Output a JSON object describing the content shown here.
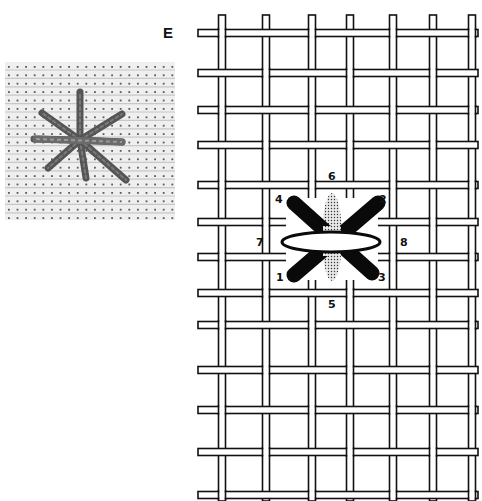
{
  "figure": {
    "label": "E"
  },
  "photo": {
    "description": "Photo of an eight-ray star stitch on evenweave fabric",
    "star_center": [
      80,
      140
    ],
    "rays": [
      [
        80,
        92
      ],
      [
        42,
        113
      ],
      [
        122,
        114
      ],
      [
        34,
        139
      ],
      [
        122,
        142
      ],
      [
        48,
        168
      ],
      [
        86,
        178
      ],
      [
        126,
        180
      ]
    ],
    "thread_color": "#555555",
    "fabric_color": "#efefef",
    "hole_color": "#2a2a2a"
  },
  "grid": {
    "vertical_threads_x": [
      222,
      266,
      312,
      350,
      393,
      433,
      472
    ],
    "horizontal_threads_y": [
      33,
      73,
      110,
      145,
      185,
      222,
      257,
      293,
      325,
      370,
      410,
      452,
      495
    ],
    "x_start": 198,
    "x_end": 478,
    "y_start": 15,
    "y_end": 501,
    "thread_width": 7,
    "stroke_color": "#111111"
  },
  "stitch": {
    "labels": [
      {
        "n": "1",
        "x": 276,
        "y": 281
      },
      {
        "n": "2",
        "x": 379,
        "y": 203
      },
      {
        "n": "3",
        "x": 378,
        "y": 281
      },
      {
        "n": "4",
        "x": 275,
        "y": 203
      },
      {
        "n": "5",
        "x": 328,
        "y": 308
      },
      {
        "n": "6",
        "x": 328,
        "y": 180
      },
      {
        "n": "7",
        "x": 256,
        "y": 246
      },
      {
        "n": "8",
        "x": 400,
        "y": 246
      }
    ],
    "black_bars": [
      {
        "from": [
          294,
          203
        ],
        "to": [
          372,
          273
        ]
      },
      {
        "from": [
          294,
          275
        ],
        "to": [
          378,
          203
        ]
      }
    ],
    "dotted_vertical": {
      "cx": 332,
      "cy": 237,
      "rx": 10,
      "ry": 44
    },
    "white_horizontal": {
      "cx": 331,
      "cy": 242,
      "rx": 49,
      "ry": 10
    }
  }
}
